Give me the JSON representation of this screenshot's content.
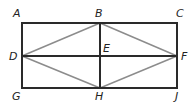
{
  "diagram": {
    "type": "geometry-figure",
    "colors": {
      "frame": "#2a2a2a",
      "rhombus": "#8c8c8c",
      "label": "#222222"
    },
    "points": {
      "A": {
        "label": "A",
        "x": 22,
        "y": 23
      },
      "B": {
        "label": "B",
        "x": 100,
        "y": 23
      },
      "C": {
        "label": "C",
        "x": 177,
        "y": 23
      },
      "D": {
        "label": "D",
        "x": 22,
        "y": 56
      },
      "E": {
        "label": "E",
        "x": 100,
        "y": 56
      },
      "F": {
        "label": "F",
        "x": 177,
        "y": 56
      },
      "G": {
        "label": "G",
        "x": 22,
        "y": 88
      },
      "H": {
        "label": "H",
        "x": 100,
        "y": 88
      },
      "J": {
        "label": "J",
        "x": 177,
        "y": 88
      }
    },
    "segments_black": [
      "AC",
      "CJ",
      "JG",
      "GA",
      "BH",
      "DF"
    ],
    "segments_gray": [
      "DB",
      "BF",
      "FH",
      "HD"
    ]
  }
}
